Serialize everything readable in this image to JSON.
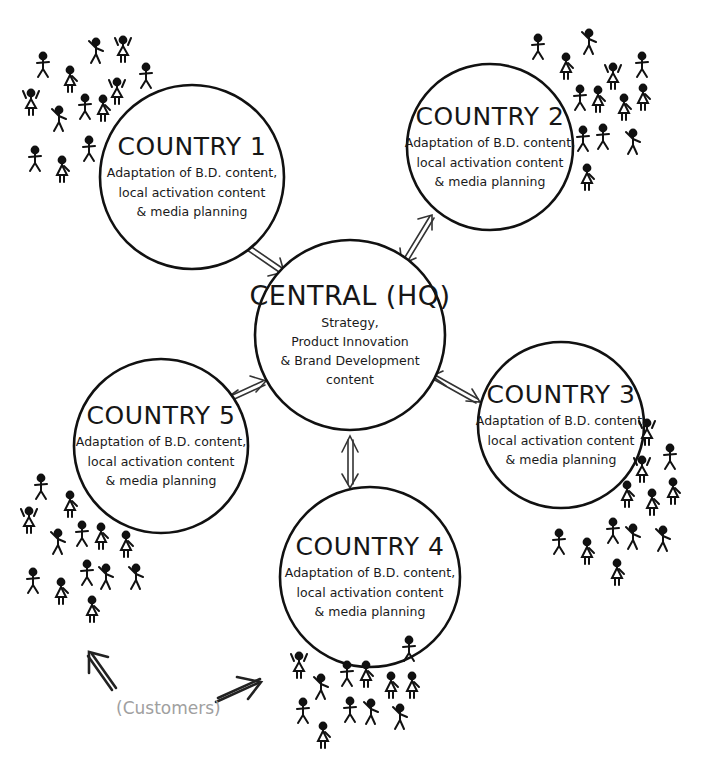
{
  "diagram": {
    "central": {
      "title": "CENTRAL (HQ)",
      "lines": [
        "Strategy,",
        "Product Innovation",
        "& Brand Development",
        "content"
      ]
    },
    "countries": [
      {
        "id": "country-1",
        "title": "COUNTRY 1",
        "lines": [
          "Adaptation of B.D. content,",
          "local activation content",
          "& media planning"
        ]
      },
      {
        "id": "country-2",
        "title": "COUNTRY 2",
        "lines": [
          "Adaptation of B.D. content,",
          "local activation content",
          "& media planning"
        ]
      },
      {
        "id": "country-3",
        "title": "COUNTRY 3",
        "lines": [
          "Adaptation of B.D. content,",
          "local activation content",
          "& media planning"
        ]
      },
      {
        "id": "country-4",
        "title": "COUNTRY 4",
        "lines": [
          "Adaptation of B.D. content,",
          "local activation content",
          "& media planning"
        ]
      },
      {
        "id": "country-5",
        "title": "COUNTRY 5",
        "lines": [
          "Adaptation of B.D. content,",
          "local activation content",
          "& media planning"
        ]
      }
    ],
    "connections": [
      {
        "from": "central",
        "to": "country-1",
        "type": "bidirectional"
      },
      {
        "from": "central",
        "to": "country-2",
        "type": "bidirectional"
      },
      {
        "from": "central",
        "to": "country-3",
        "type": "bidirectional"
      },
      {
        "from": "central",
        "to": "country-4",
        "type": "bidirectional"
      },
      {
        "from": "central",
        "to": "country-5",
        "type": "bidirectional"
      }
    ],
    "annotation": {
      "label": "(Customers)",
      "color": "#a0a0a0"
    },
    "colors": {
      "stroke": "#111111",
      "background": "#ffffff",
      "annotation": "#a0a0a0"
    }
  }
}
